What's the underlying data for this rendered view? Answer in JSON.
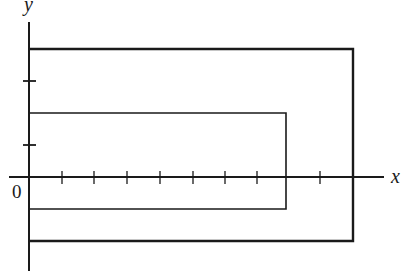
{
  "diagram": {
    "axes": {
      "x_label": "x",
      "y_label": "y",
      "origin_label": "0",
      "x_ticks": [
        1,
        2,
        3,
        4,
        5,
        6,
        7,
        9
      ],
      "y_ticks": [
        1,
        3
      ]
    },
    "shapes": [
      {
        "name": "inner-rectangle",
        "x_min": 0,
        "x_max": 8,
        "y_min": -1,
        "y_max": 2
      },
      {
        "name": "outer-rectangle",
        "x_min": 0,
        "x_max": 10,
        "y_min": -2,
        "y_max": 4
      }
    ],
    "colors": {
      "stroke": "#1a1a1a",
      "background": "#ffffff"
    }
  }
}
